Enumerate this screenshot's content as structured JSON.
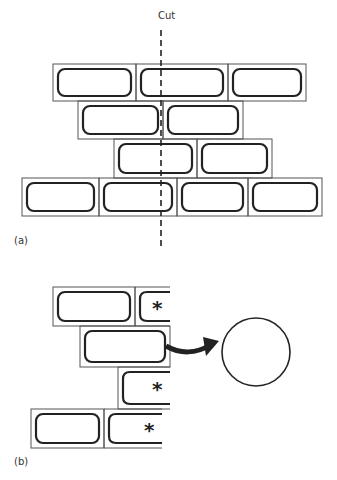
{
  "figure": {
    "part_a": {
      "label": "(a)",
      "cut_label": "Cut",
      "rows": [
        {
          "x": 53,
          "y": 64,
          "h": 37,
          "bricks": [
            83,
            92,
            78
          ]
        },
        {
          "x": 78,
          "y": 101,
          "h": 38,
          "bricks": [
            85,
            80
          ]
        },
        {
          "x": 114,
          "y": 139,
          "h": 39,
          "bricks": [
            83,
            75
          ]
        },
        {
          "x": 22,
          "y": 178,
          "h": 38,
          "bricks": [
            77,
            78,
            71,
            74
          ]
        }
      ],
      "cut_line": {
        "x": 161,
        "y1": 30,
        "y2": 250
      }
    },
    "part_b": {
      "label": "(b)",
      "marker": "*",
      "rows": [
        {
          "x": 53,
          "y": 287,
          "h": 39,
          "bricks": [
            82,
            35
          ],
          "marked": [
            false,
            true
          ]
        },
        {
          "x": 80,
          "y": 326,
          "h": 41,
          "bricks": [
            90
          ],
          "marked": [
            false
          ],
          "removed": true
        },
        {
          "x": 118,
          "y": 367,
          "h": 42,
          "bricks": [
            52
          ],
          "marked": [
            true
          ]
        },
        {
          "x": 31,
          "y": 409,
          "h": 39,
          "bricks": [
            73,
            58
          ],
          "marked": [
            false,
            true
          ]
        }
      ],
      "circle": {
        "cx": 256,
        "cy": 352,
        "r": 34
      }
    },
    "colors": {
      "line": "#222222",
      "thin": "#555555",
      "text": "#333333"
    }
  }
}
